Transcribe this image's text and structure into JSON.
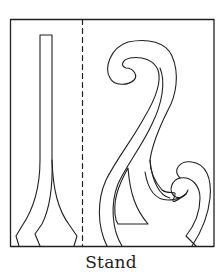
{
  "figure": {
    "caption": "Stand",
    "stroke_color": "#231f20",
    "background": "#ffffff",
    "parts": [
      {
        "name": "outer-frame",
        "description": "rectangular sheet outline"
      },
      {
        "name": "fold-line",
        "description": "vertical dashed fold line"
      },
      {
        "name": "vase-stem-piece",
        "description": "tall narrow stem flaring into a base"
      },
      {
        "name": "scroll-piece",
        "description": "S-shaped scroll with top curl, inner spike and bottom-right curl"
      }
    ]
  }
}
